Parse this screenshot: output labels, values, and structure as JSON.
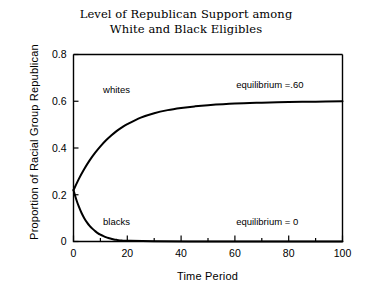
{
  "chart_data": {
    "type": "line",
    "title": "Level of Republican Support among\nWhite and Black Eligibles",
    "xlabel": "Time Period",
    "ylabel": "Proportion of Racial Group Republican",
    "xlim": [
      0,
      100
    ],
    "ylim": [
      0,
      0.8
    ],
    "xticks": [
      0,
      20,
      40,
      60,
      80,
      100
    ],
    "xtick_labels": [
      "0",
      "20",
      "40",
      "60",
      "80",
      "100"
    ],
    "xminor_ticks": [
      10,
      30,
      50,
      70,
      90
    ],
    "yticks": [
      0,
      0.2,
      0.4,
      0.6,
      0.8
    ],
    "ytick_labels": [
      "0",
      "0.2",
      "0.4",
      "0.6",
      "0.8"
    ],
    "grid": false,
    "legend": "inline curve labels",
    "series": [
      {
        "name": "whites",
        "label": "whites",
        "color": "#000000",
        "start_value": 0.22,
        "equilibrium": 0.6,
        "x": [
          0,
          2,
          4,
          6,
          8,
          10,
          12,
          14,
          16,
          18,
          20,
          25,
          30,
          35,
          40,
          45,
          50,
          60,
          70,
          80,
          90,
          100
        ],
        "y": [
          0.22,
          0.268,
          0.31,
          0.347,
          0.379,
          0.407,
          0.432,
          0.453,
          0.472,
          0.488,
          0.502,
          0.53,
          0.549,
          0.562,
          0.571,
          0.578,
          0.583,
          0.59,
          0.594,
          0.597,
          0.598,
          0.6
        ]
      },
      {
        "name": "blacks",
        "label": "blacks",
        "color": "#000000",
        "start_value": 0.22,
        "equilibrium": 0.0,
        "x": [
          0,
          1,
          2,
          3,
          4,
          5,
          6,
          7,
          8,
          9,
          10,
          11,
          12,
          13,
          14,
          15,
          16,
          18,
          20,
          30,
          50,
          70,
          100
        ],
        "y": [
          0.22,
          0.181,
          0.149,
          0.122,
          0.1,
          0.082,
          0.067,
          0.055,
          0.045,
          0.036,
          0.029,
          0.024,
          0.019,
          0.015,
          0.012,
          0.009,
          0.007,
          0.004,
          0.003,
          0.001,
          0.0,
          0.0,
          0.0
        ]
      }
    ],
    "annotations": [
      {
        "name": "equilibrium-white",
        "text": "equilibrium =.60",
        "x": 73,
        "y": 0.655
      },
      {
        "name": "equilibrium-black",
        "text": "equilibrium = 0",
        "x": 72,
        "y": 0.072
      },
      {
        "name": "label-whites",
        "text": "whites",
        "x": 16,
        "y": 0.635
      },
      {
        "name": "label-blacks",
        "text": "blacks",
        "x": 16,
        "y": 0.072
      }
    ]
  }
}
